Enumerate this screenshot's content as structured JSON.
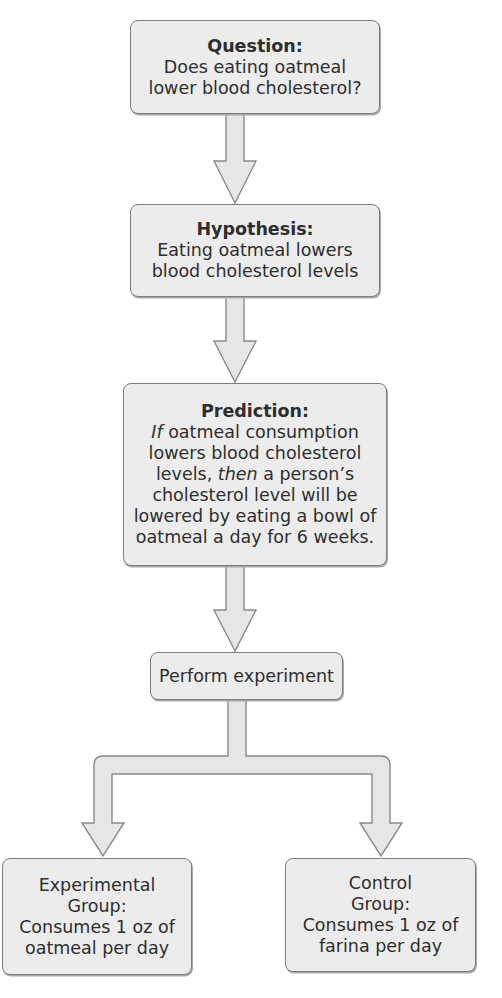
{
  "diagram": {
    "type": "flowchart",
    "colors": {
      "box_fill": "#ececec",
      "box_border": "#7d7d7d",
      "arrow_fill": "#e6e6e6",
      "arrow_stroke": "#8a8a8a",
      "text": "#2e2e2e"
    },
    "nodes": {
      "question": {
        "title": "Question:",
        "lines": [
          "Does eating oatmeal",
          "lower blood cholesterol?"
        ]
      },
      "hypothesis": {
        "title": "Hypothesis:",
        "lines": [
          "Eating oatmeal lowers",
          "blood cholesterol levels"
        ]
      },
      "prediction": {
        "title": "Prediction:",
        "line1_italic": "If",
        "line1_rest": " oatmeal consumption",
        "line2": "lowers blood cholesterol",
        "line3_pre": "levels, ",
        "line3_italic": "then",
        "line3_rest": " a person’s",
        "line4": "cholesterol level will be",
        "line5": "lowered by eating a bowl of",
        "line6": "oatmeal a day for 6 weeks."
      },
      "perform": {
        "label": "Perform experiment"
      },
      "experimental": {
        "lines": [
          "Experimental",
          "Group:",
          "Consumes 1 oz of",
          "oatmeal per day"
        ]
      },
      "control": {
        "lines": [
          "Control",
          "Group:",
          "Consumes 1 oz of",
          "farina per day"
        ]
      }
    },
    "edges": [
      {
        "from": "question",
        "to": "hypothesis"
      },
      {
        "from": "hypothesis",
        "to": "prediction"
      },
      {
        "from": "prediction",
        "to": "perform"
      },
      {
        "from": "perform",
        "to": "experimental"
      },
      {
        "from": "perform",
        "to": "control"
      }
    ]
  }
}
